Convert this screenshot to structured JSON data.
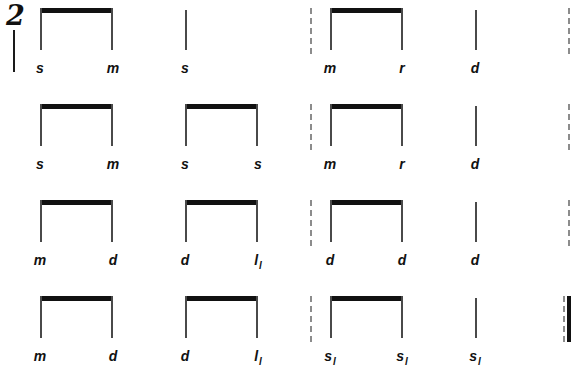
{
  "score": {
    "time_signature": "2",
    "notation_system": "tonic sol-fa",
    "rows": [
      {
        "row_index": 1,
        "syllables": [
          {
            "text": "s",
            "octave": "",
            "x": 40
          },
          {
            "text": "m",
            "octave": "",
            "x": 113
          },
          {
            "text": "s",
            "octave": "",
            "x": 185
          },
          {
            "text": "m",
            "octave": "",
            "x": 330
          },
          {
            "text": "r",
            "octave": "",
            "x": 402
          },
          {
            "text": "d",
            "octave": "",
            "x": 475
          }
        ],
        "beams": [
          {
            "x": 40,
            "width": 73
          },
          {
            "x": 330,
            "width": 73
          }
        ],
        "stems": [
          {
            "x": 185
          },
          {
            "x": 475
          }
        ],
        "barlines_dashed": [
          {
            "x": 310
          },
          {
            "x": 568
          }
        ],
        "barline_final": null
      },
      {
        "row_index": 2,
        "syllables": [
          {
            "text": "s",
            "octave": "",
            "x": 40
          },
          {
            "text": "m",
            "octave": "",
            "x": 113
          },
          {
            "text": "s",
            "octave": "",
            "x": 185
          },
          {
            "text": "s",
            "octave": "",
            "x": 258
          },
          {
            "text": "m",
            "octave": "",
            "x": 330
          },
          {
            "text": "r",
            "octave": "",
            "x": 402
          },
          {
            "text": "d",
            "octave": "",
            "x": 475
          }
        ],
        "beams": [
          {
            "x": 40,
            "width": 73
          },
          {
            "x": 185,
            "width": 73
          },
          {
            "x": 330,
            "width": 73
          }
        ],
        "stems": [
          {
            "x": 475
          }
        ],
        "barlines_dashed": [
          {
            "x": 310
          },
          {
            "x": 568
          }
        ],
        "barline_final": null
      },
      {
        "row_index": 3,
        "syllables": [
          {
            "text": "m",
            "octave": "",
            "x": 40
          },
          {
            "text": "d",
            "octave": "",
            "x": 113
          },
          {
            "text": "d",
            "octave": "",
            "x": 185
          },
          {
            "text": "l",
            "octave": "l",
            "x": 258
          },
          {
            "text": "d",
            "octave": "",
            "x": 330
          },
          {
            "text": "d",
            "octave": "",
            "x": 402
          },
          {
            "text": "d",
            "octave": "",
            "x": 475
          }
        ],
        "beams": [
          {
            "x": 40,
            "width": 73
          },
          {
            "x": 185,
            "width": 73
          },
          {
            "x": 330,
            "width": 73
          }
        ],
        "stems": [
          {
            "x": 475
          }
        ],
        "barlines_dashed": [
          {
            "x": 310
          },
          {
            "x": 568
          }
        ],
        "barline_final": null
      },
      {
        "row_index": 4,
        "syllables": [
          {
            "text": "m",
            "octave": "",
            "x": 40
          },
          {
            "text": "d",
            "octave": "",
            "x": 113
          },
          {
            "text": "d",
            "octave": "",
            "x": 185
          },
          {
            "text": "l",
            "octave": "l",
            "x": 258
          },
          {
            "text": "s",
            "octave": "l",
            "x": 330
          },
          {
            "text": "s",
            "octave": "l",
            "x": 402
          },
          {
            "text": "s",
            "octave": "l",
            "x": 475
          }
        ],
        "beams": [
          {
            "x": 40,
            "width": 73
          },
          {
            "x": 185,
            "width": 73
          },
          {
            "x": 330,
            "width": 73
          }
        ],
        "stems": [
          {
            "x": 475
          }
        ],
        "barlines_dashed": [
          {
            "x": 310
          }
        ],
        "barline_final": {
          "x": 563
        }
      }
    ],
    "row_tops": [
      0,
      96,
      192,
      288
    ],
    "colors": {
      "ink": "#111111",
      "stem": "#4a4a4a",
      "barline": "#8c8c8c",
      "background": "#ffffff"
    }
  }
}
